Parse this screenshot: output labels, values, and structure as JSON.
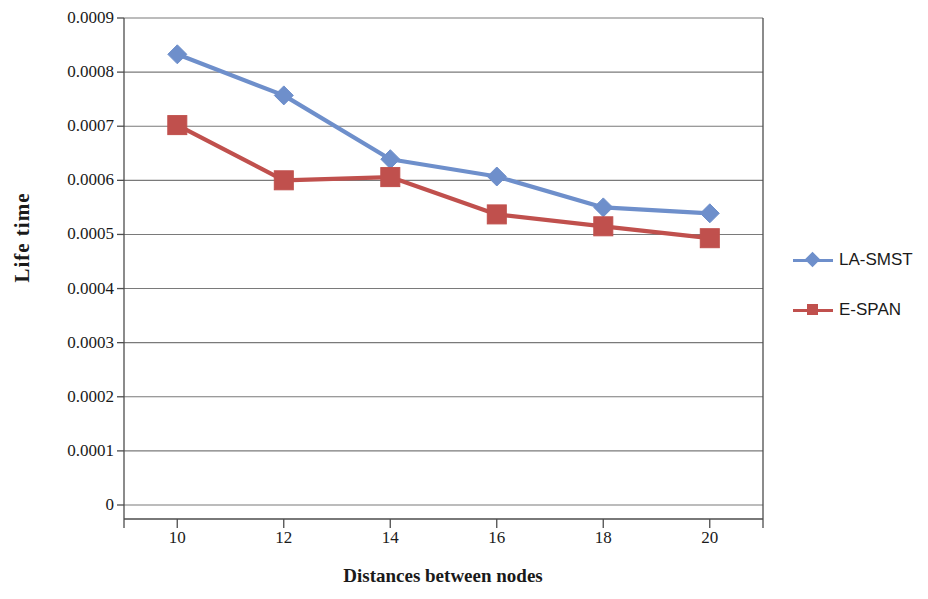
{
  "chart_data": {
    "type": "line",
    "title": "",
    "xlabel": "Distances between nodes",
    "ylabel": "Life time",
    "x": [
      10,
      12,
      14,
      16,
      18,
      20
    ],
    "xtick_labels": [
      "10",
      "12",
      "14",
      "16",
      "18",
      "20"
    ],
    "ytick_labels": [
      "0",
      "0.0001",
      "0.0002",
      "0.0003",
      "0.0004",
      "0.0005",
      "0.0006",
      "0.0007",
      "0.0008",
      "0.0009"
    ],
    "ytick_values": [
      0,
      0.0001,
      0.0002,
      0.0003,
      0.0004,
      0.0005,
      0.0006,
      0.0007,
      0.0008,
      0.0009
    ],
    "ylim": [
      0,
      0.0009
    ],
    "xlim": [
      9,
      21
    ],
    "grid": "horizontal",
    "legend_position": "right",
    "series": [
      {
        "name": "LA-SMST",
        "color": "#6E8FCB",
        "marker": "diamond",
        "values": [
          0.000833,
          0.000757,
          0.000639,
          0.000607,
          0.00055,
          0.000539
        ]
      },
      {
        "name": "E-SPAN",
        "color": "#C0504D",
        "marker": "square",
        "values": [
          0.000702,
          0.0006,
          0.000606,
          0.000537,
          0.000515,
          0.000493
        ]
      }
    ]
  },
  "legend": {
    "entries": [
      {
        "label": "LA-SMST"
      },
      {
        "label": "E-SPAN"
      }
    ]
  },
  "colors": {
    "series_1": "#6E8FCB",
    "series_2": "#C0504D",
    "axis": "#4d4d4d",
    "grid": "#7a7a7a",
    "text": "#1a1a1a",
    "background": "#ffffff"
  }
}
